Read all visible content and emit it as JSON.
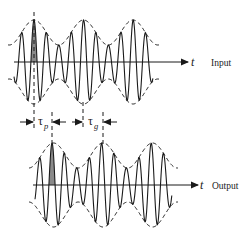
{
  "figure": {
    "panels": [
      {
        "name": "input",
        "label": "Input",
        "axis_label": "t"
      },
      {
        "name": "output",
        "label": "Output",
        "axis_label": "t"
      }
    ],
    "delays": {
      "phase": {
        "symbol": "τ",
        "subscript": "p"
      },
      "group": {
        "symbol": "τ",
        "subscript": "g"
      }
    },
    "colors": {
      "line": "#1a1a1a",
      "shade": "#8a8a8a",
      "background": "#ffffff"
    }
  }
}
